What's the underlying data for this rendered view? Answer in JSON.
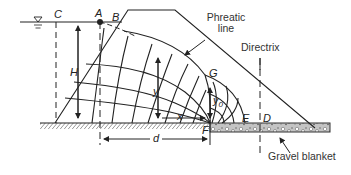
{
  "diagram": {
    "labels": {
      "C": "C",
      "A": "A",
      "B": "B",
      "H": "H",
      "y": "y",
      "x": "x",
      "y0_base": "y",
      "y0_sub": "0",
      "G": "G",
      "F": "F",
      "E": "E",
      "D": "D",
      "d": "d"
    },
    "annotations": {
      "phreatic_line_1": "Phreatic",
      "phreatic_line_2": "line",
      "directrix": "Directrix",
      "gravel_blanket": "Gravel blanket"
    },
    "icons": {
      "water_level": "water-surface-triangle"
    },
    "colors": {
      "line": "#222222",
      "gravel_fill": "#bdbdbd",
      "background": "#ffffff"
    }
  }
}
